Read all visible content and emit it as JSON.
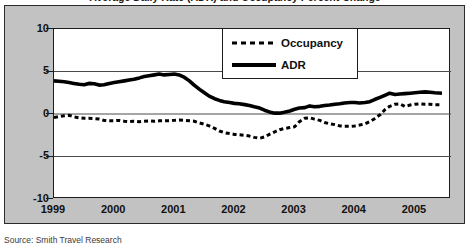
{
  "figure": {
    "title": "Average Daily Rate (ADR) and Occupancy Percent Change",
    "source_note": "Source: Smith Travel Research"
  },
  "legend": {
    "position": "top-right-inside",
    "items": [
      {
        "label": "Occupancy",
        "style": "dashed",
        "key_icon": "dashed-line-icon"
      },
      {
        "label": "ADR",
        "style": "solid",
        "key_icon": "solid-line-icon"
      }
    ]
  },
  "chart_data": {
    "type": "line",
    "title": "Average Daily Rate (ADR) and Occupancy Percent Change",
    "xlabel": "",
    "ylabel": "",
    "xlim": [
      1999.0,
      2005.6
    ],
    "ylim": [
      -10,
      10
    ],
    "yticks": [
      10,
      5,
      0,
      -5,
      -10
    ],
    "ytick_labels": [
      "10",
      "5",
      "0",
      "-5",
      "-10"
    ],
    "xticks": [
      1999,
      2000,
      2001,
      2002,
      2003,
      2004,
      2005
    ],
    "xtick_labels": [
      "1999",
      "2000",
      "2001",
      "2002",
      "2003",
      "2004",
      "2005"
    ],
    "grid": "horizontal-only",
    "gridlines_at": [
      5,
      0,
      -5
    ],
    "line_color": "#000000",
    "series": [
      {
        "name": "ADR",
        "style": "solid",
        "x": [
          1999.0,
          1999.08,
          1999.17,
          1999.25,
          1999.33,
          1999.42,
          1999.5,
          1999.58,
          1999.67,
          1999.75,
          1999.83,
          1999.92,
          2000.0,
          2000.08,
          2000.17,
          2000.25,
          2000.33,
          2000.42,
          2000.5,
          2000.58,
          2000.67,
          2000.75,
          2000.83,
          2000.92,
          2001.0,
          2001.08,
          2001.17,
          2001.25,
          2001.33,
          2001.42,
          2001.5,
          2001.58,
          2001.67,
          2001.75,
          2001.83,
          2001.92,
          2002.0,
          2002.08,
          2002.17,
          2002.25,
          2002.33,
          2002.42,
          2002.5,
          2002.58,
          2002.67,
          2002.75,
          2002.83,
          2002.92,
          2003.0,
          2003.08,
          2003.17,
          2003.25,
          2003.33,
          2003.42,
          2003.5,
          2003.58,
          2003.67,
          2003.75,
          2003.83,
          2003.92,
          2004.0,
          2004.08,
          2004.17,
          2004.25,
          2004.33,
          2004.42,
          2004.5,
          2004.58,
          2004.67,
          2004.75,
          2004.83,
          2004.92,
          2005.0,
          2005.08,
          2005.17,
          2005.25,
          2005.33,
          2005.45
        ],
        "values": [
          3.9,
          3.85,
          3.8,
          3.7,
          3.6,
          3.5,
          3.45,
          3.6,
          3.55,
          3.4,
          3.45,
          3.6,
          3.7,
          3.8,
          3.9,
          4.0,
          4.1,
          4.25,
          4.4,
          4.5,
          4.6,
          4.7,
          4.6,
          4.65,
          4.7,
          4.6,
          4.3,
          3.9,
          3.4,
          2.9,
          2.5,
          2.1,
          1.8,
          1.6,
          1.45,
          1.35,
          1.25,
          1.2,
          1.1,
          1.0,
          0.85,
          0.7,
          0.45,
          0.25,
          0.1,
          0.1,
          0.2,
          0.35,
          0.55,
          0.7,
          0.75,
          0.95,
          0.85,
          0.9,
          1.0,
          1.05,
          1.15,
          1.2,
          1.3,
          1.35,
          1.35,
          1.3,
          1.35,
          1.45,
          1.7,
          1.95,
          2.2,
          2.45,
          2.3,
          2.35,
          2.4,
          2.45,
          2.5,
          2.55,
          2.6,
          2.55,
          2.5,
          2.45
        ]
      },
      {
        "name": "Occupancy",
        "style": "dashed",
        "x": [
          1999.0,
          1999.08,
          1999.17,
          1999.25,
          1999.33,
          1999.42,
          1999.5,
          1999.58,
          1999.67,
          1999.75,
          1999.83,
          1999.92,
          2000.0,
          2000.08,
          2000.17,
          2000.25,
          2000.33,
          2000.42,
          2000.5,
          2000.58,
          2000.67,
          2000.75,
          2000.83,
          2000.92,
          2001.0,
          2001.08,
          2001.17,
          2001.25,
          2001.33,
          2001.42,
          2001.5,
          2001.58,
          2001.67,
          2001.75,
          2001.83,
          2001.92,
          2002.0,
          2002.08,
          2002.17,
          2002.25,
          2002.33,
          2002.42,
          2002.5,
          2002.58,
          2002.67,
          2002.75,
          2002.83,
          2002.92,
          2003.0,
          2003.08,
          2003.17,
          2003.25,
          2003.33,
          2003.42,
          2003.5,
          2003.58,
          2003.67,
          2003.75,
          2003.83,
          2003.92,
          2004.0,
          2004.08,
          2004.17,
          2004.25,
          2004.33,
          2004.42,
          2004.5,
          2004.58,
          2004.67,
          2004.75,
          2004.83,
          2004.92,
          2005.0,
          2005.08,
          2005.17,
          2005.25,
          2005.33,
          2005.45
        ],
        "values": [
          -0.4,
          -0.3,
          -0.2,
          -0.15,
          -0.35,
          -0.45,
          -0.5,
          -0.5,
          -0.55,
          -0.6,
          -0.75,
          -0.8,
          -0.8,
          -0.75,
          -0.85,
          -0.9,
          -0.85,
          -0.9,
          -0.85,
          -0.8,
          -0.85,
          -0.8,
          -0.8,
          -0.8,
          -0.75,
          -0.7,
          -0.75,
          -0.8,
          -0.85,
          -1.05,
          -1.2,
          -1.4,
          -1.7,
          -2.0,
          -2.2,
          -2.3,
          -2.4,
          -2.45,
          -2.5,
          -2.6,
          -2.75,
          -2.85,
          -2.7,
          -2.4,
          -2.1,
          -1.85,
          -1.7,
          -1.6,
          -1.5,
          -0.9,
          -0.5,
          -0.45,
          -0.6,
          -0.75,
          -1.0,
          -1.15,
          -1.25,
          -1.4,
          -1.45,
          -1.45,
          -1.4,
          -1.3,
          -1.15,
          -0.9,
          -0.55,
          -0.1,
          0.5,
          0.9,
          1.15,
          1.2,
          0.9,
          1.05,
          1.15,
          1.2,
          1.15,
          1.15,
          1.1,
          1.1
        ]
      }
    ]
  }
}
